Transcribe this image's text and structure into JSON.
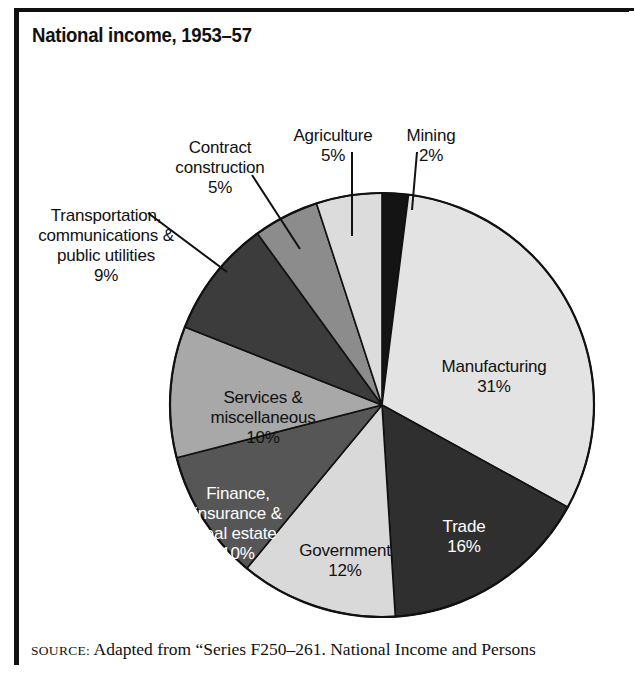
{
  "title": "National income, 1953–57",
  "source": {
    "label": "SOURCE:",
    "text": " Adapted from “Series F250–261. National Income and Persons"
  },
  "chart_data": {
    "type": "pie",
    "title": "National income, 1953–57",
    "xlabel": "",
    "ylabel": "",
    "unit": "percent",
    "legend": "none (direct labels)",
    "grid": false,
    "start_angle_deg": 0,
    "direction": "clockwise",
    "categories": [
      "Mining",
      "Manufacturing",
      "Trade",
      "Government",
      "Finance, insurance & real estate",
      "Services & miscellaneous",
      "Transportation, communications & public utilities",
      "Contract construction",
      "Agriculture"
    ],
    "values": [
      2,
      31,
      16,
      12,
      10,
      10,
      9,
      5,
      5
    ],
    "slices": [
      {
        "name": "Mining",
        "label": "Mining",
        "pct": "2%",
        "value": 2,
        "color": "#141414",
        "label_placement": "outside",
        "text_color": "#111111"
      },
      {
        "name": "Manufacturing",
        "label": "Manufacturing",
        "pct": "31%",
        "value": 31,
        "color": "#e3e3e3",
        "label_placement": "inside",
        "text_color": "#111111"
      },
      {
        "name": "Trade",
        "label": "Trade",
        "pct": "16%",
        "value": 16,
        "color": "#2f2f2f",
        "label_placement": "inside",
        "text_color": "#ffffff"
      },
      {
        "name": "Government",
        "label": "Government",
        "pct": "12%",
        "value": 12,
        "color": "#d9d9d9",
        "label_placement": "inside",
        "text_color": "#111111"
      },
      {
        "name": "Finance, insurance & real estate",
        "label": "Finance,\ninsurance &\nreal estate",
        "pct": "10%",
        "value": 10,
        "color": "#565656",
        "label_placement": "inside",
        "text_color": "#ffffff"
      },
      {
        "name": "Services & miscellaneous",
        "label": "Services &\nmiscellaneous",
        "pct": "10%",
        "value": 10,
        "color": "#a8a8a8",
        "label_placement": "inside",
        "text_color": "#111111"
      },
      {
        "name": "Transportation, communications & public utilities",
        "label": "Transportation,\ncommunications &\npublic utilities",
        "pct": "9%",
        "value": 9,
        "color": "#3c3c3c",
        "label_placement": "outside",
        "text_color": "#111111"
      },
      {
        "name": "Contract construction",
        "label": "Contract\nconstruction",
        "pct": "5%",
        "value": 5,
        "color": "#8c8c8c",
        "label_placement": "outside",
        "text_color": "#111111"
      },
      {
        "name": "Agriculture",
        "label": "Agriculture",
        "pct": "5%",
        "value": 5,
        "color": "#dcdcdc",
        "label_placement": "outside",
        "text_color": "#111111"
      }
    ]
  }
}
